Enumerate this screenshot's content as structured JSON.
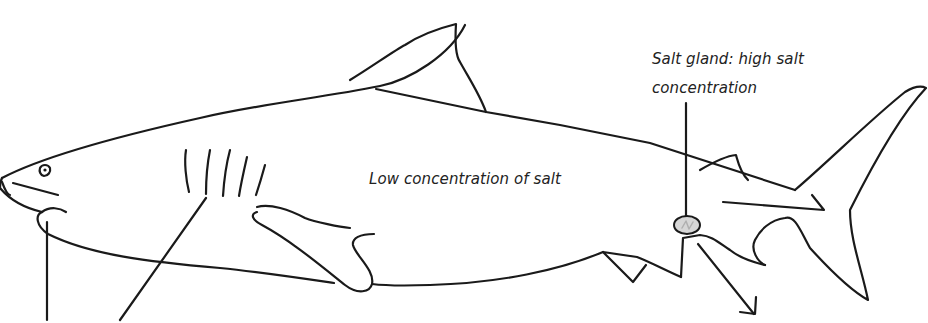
{
  "diagram": {
    "labels": {
      "salt_gland_line1": "Salt gland: high salt",
      "salt_gland_line2": "concentration",
      "body_interior": "Low concentration of salt"
    },
    "colors": {
      "stroke": "#1a1a1a",
      "text": "#222222",
      "background": "#ffffff",
      "gland_fill": "#cfcfcf"
    },
    "icons": {
      "arrow": "salt-excretion-arrow-icon",
      "gland": "salt-gland-icon"
    }
  }
}
